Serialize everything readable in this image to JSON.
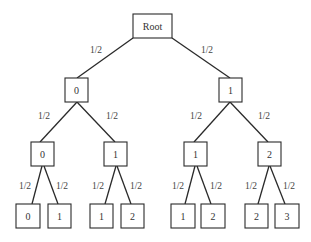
{
  "diagram": {
    "type": "probability-tree",
    "nodes": [
      {
        "id": "root",
        "label": "Root",
        "x": 133,
        "y": 14,
        "w": 39,
        "h": 24
      },
      {
        "id": "l1a",
        "label": "0",
        "x": 65,
        "y": 78,
        "w": 23,
        "h": 24
      },
      {
        "id": "l1b",
        "label": "1",
        "x": 219,
        "y": 78,
        "w": 23,
        "h": 24
      },
      {
        "id": "l2a",
        "label": "0",
        "x": 31,
        "y": 142,
        "w": 23,
        "h": 24
      },
      {
        "id": "l2b",
        "label": "1",
        "x": 104,
        "y": 142,
        "w": 23,
        "h": 24
      },
      {
        "id": "l2c",
        "label": "1",
        "x": 184,
        "y": 142,
        "w": 23,
        "h": 24
      },
      {
        "id": "l2d",
        "label": "2",
        "x": 258,
        "y": 142,
        "w": 23,
        "h": 24
      },
      {
        "id": "l3a",
        "label": "0",
        "x": 16,
        "y": 204,
        "w": 24,
        "h": 24
      },
      {
        "id": "l3b",
        "label": "1",
        "x": 48,
        "y": 204,
        "w": 23,
        "h": 24
      },
      {
        "id": "l3c",
        "label": "1",
        "x": 90,
        "y": 204,
        "w": 23,
        "h": 24
      },
      {
        "id": "l3d",
        "label": "2",
        "x": 121,
        "y": 204,
        "w": 23,
        "h": 24
      },
      {
        "id": "l3e",
        "label": "1",
        "x": 171,
        "y": 204,
        "w": 24,
        "h": 24
      },
      {
        "id": "l3f",
        "label": "2",
        "x": 201,
        "y": 204,
        "w": 24,
        "h": 24
      },
      {
        "id": "l3g",
        "label": "2",
        "x": 245,
        "y": 204,
        "w": 23,
        "h": 24
      },
      {
        "id": "l3h",
        "label": "3",
        "x": 275,
        "y": 204,
        "w": 24,
        "h": 24
      }
    ],
    "edges": [
      {
        "from": "root",
        "to": "l1a",
        "label": "1/2",
        "x1": 133,
        "y1": 38,
        "x2": 77,
        "y2": 78,
        "lx": 96,
        "ly": 50
      },
      {
        "from": "root",
        "to": "l1b",
        "label": "1/2",
        "x1": 172,
        "y1": 38,
        "x2": 230,
        "y2": 78,
        "lx": 207,
        "ly": 50
      },
      {
        "from": "l1a",
        "to": "l2a",
        "label": "1/2",
        "x1": 77,
        "y1": 102,
        "x2": 40,
        "y2": 142,
        "lx": 44,
        "ly": 116
      },
      {
        "from": "l1a",
        "to": "l2b",
        "label": "1/2",
        "x1": 77,
        "y1": 102,
        "x2": 115,
        "y2": 142,
        "lx": 112,
        "ly": 116
      },
      {
        "from": "l1b",
        "to": "l2c",
        "label": "1/2",
        "x1": 230,
        "y1": 102,
        "x2": 194,
        "y2": 142,
        "lx": 196,
        "ly": 116
      },
      {
        "from": "l1b",
        "to": "l2d",
        "label": "1/2",
        "x1": 230,
        "y1": 102,
        "x2": 268,
        "y2": 142,
        "lx": 264,
        "ly": 116
      },
      {
        "from": "l2a",
        "to": "l3a",
        "label": "1/2",
        "x1": 42,
        "y1": 166,
        "x2": 32,
        "y2": 204,
        "lx": 25,
        "ly": 186
      },
      {
        "from": "l2a",
        "to": "l3b",
        "label": "1/2",
        "x1": 44,
        "y1": 166,
        "x2": 58,
        "y2": 204,
        "lx": 62,
        "ly": 186
      },
      {
        "from": "l2b",
        "to": "l3c",
        "label": "1/2",
        "x1": 116,
        "y1": 166,
        "x2": 105,
        "y2": 204,
        "lx": 98,
        "ly": 186
      },
      {
        "from": "l2b",
        "to": "l3d",
        "label": "1/2",
        "x1": 117,
        "y1": 166,
        "x2": 131,
        "y2": 204,
        "lx": 136,
        "ly": 186
      },
      {
        "from": "l2c",
        "to": "l3e",
        "label": "1/2",
        "x1": 195,
        "y1": 166,
        "x2": 185,
        "y2": 204,
        "lx": 178,
        "ly": 186
      },
      {
        "from": "l2c",
        "to": "l3f",
        "label": "1/2",
        "x1": 197,
        "y1": 166,
        "x2": 211,
        "y2": 204,
        "lx": 216,
        "ly": 186
      },
      {
        "from": "l2d",
        "to": "l3g",
        "label": "1/2",
        "x1": 269,
        "y1": 166,
        "x2": 258,
        "y2": 204,
        "lx": 251,
        "ly": 186
      },
      {
        "from": "l2d",
        "to": "l3h",
        "label": "1/2",
        "x1": 270,
        "y1": 166,
        "x2": 285,
        "y2": 204,
        "lx": 289,
        "ly": 186
      }
    ],
    "colors": {
      "line": "#2a2a2a",
      "text": "#333333",
      "background": "#ffffff"
    }
  }
}
